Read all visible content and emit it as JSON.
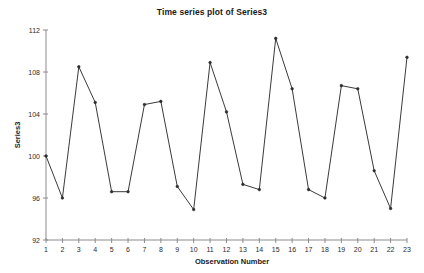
{
  "chart_data": {
    "type": "line",
    "title": "Time series plot of Series3",
    "xlabel": "Observation Number",
    "ylabel": "Series3",
    "x": [
      1,
      2,
      3,
      4,
      5,
      6,
      7,
      8,
      9,
      10,
      11,
      12,
      13,
      14,
      15,
      16,
      17,
      18,
      19,
      20,
      21,
      22,
      23
    ],
    "values": [
      100.0,
      96.0,
      108.5,
      105.1,
      96.6,
      96.6,
      104.9,
      105.2,
      97.1,
      94.9,
      108.9,
      104.2,
      97.3,
      96.8,
      111.2,
      106.4,
      96.8,
      96.0,
      106.7,
      106.4,
      98.6,
      95.0,
      109.4
    ],
    "series": [
      {
        "name": "Series3",
        "values": [
          100.0,
          96.0,
          108.5,
          105.1,
          96.6,
          96.6,
          104.9,
          105.2,
          97.1,
          94.9,
          108.9,
          104.2,
          97.3,
          96.8,
          111.2,
          106.4,
          96.8,
          96.0,
          106.7,
          106.4,
          98.6,
          95.0,
          109.4
        ]
      }
    ],
    "xlim": [
      1,
      23
    ],
    "ylim": [
      92,
      112
    ],
    "ytick_labels": [
      "92",
      "96",
      "100",
      "104",
      "108",
      "112"
    ],
    "yticks": [
      92,
      96,
      100,
      104,
      108,
      112
    ],
    "xtick_labels": [
      "1",
      "2",
      "3",
      "4",
      "5",
      "6",
      "7",
      "8",
      "9",
      "10",
      "11",
      "12",
      "13",
      "14",
      "15",
      "16",
      "17",
      "18",
      "19",
      "20",
      "21",
      "22",
      "23"
    ],
    "grid": false,
    "legend": null,
    "marker": "dot",
    "line_color": "#3a3a3a",
    "marker_color": "#2b2b2b",
    "axis_color": "#8c8c8c",
    "background_color": "#ffffff"
  }
}
